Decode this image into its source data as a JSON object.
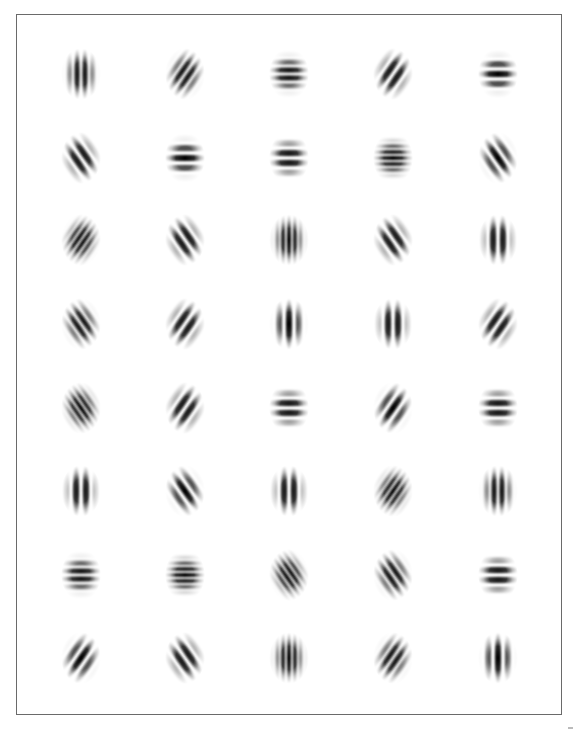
{
  "figure": {
    "rows": 8,
    "cols": 5,
    "col_centers": [
      81,
      185,
      289,
      393,
      498
    ],
    "row_centers": [
      74,
      158,
      240,
      324,
      408,
      491,
      575,
      658
    ],
    "ink_color": "#000000",
    "frame_color": "#6a6a6a",
    "patches": [
      [
        {
          "angle": 0,
          "freq": 3,
          "phase": "odd"
        },
        {
          "angle": 45,
          "freq": 3,
          "phase": "odd"
        },
        {
          "angle": 90,
          "freq": 3,
          "phase": "odd"
        },
        {
          "angle": 45,
          "freq": 2,
          "phase": "odd"
        },
        {
          "angle": 90,
          "freq": 2,
          "phase": "even"
        }
      ],
      [
        {
          "angle": 135,
          "freq": 2,
          "phase": "odd"
        },
        {
          "angle": 90,
          "freq": 2,
          "phase": "even"
        },
        {
          "angle": 90,
          "freq": 2,
          "phase": "odd"
        },
        {
          "angle": 90,
          "freq": 4,
          "phase": "even"
        },
        {
          "angle": 135,
          "freq": 2,
          "phase": "even"
        }
      ],
      [
        {
          "angle": 45,
          "freq": 4,
          "phase": "odd"
        },
        {
          "angle": 135,
          "freq": 2,
          "phase": "odd"
        },
        {
          "angle": 0,
          "freq": 4,
          "phase": "even"
        },
        {
          "angle": 135,
          "freq": 2,
          "phase": "odd"
        },
        {
          "angle": 0,
          "freq": 2,
          "phase": "odd"
        }
      ],
      [
        {
          "angle": 135,
          "freq": 3,
          "phase": "odd"
        },
        {
          "angle": 45,
          "freq": 2,
          "phase": "odd"
        },
        {
          "angle": 0,
          "freq": 2,
          "phase": "even"
        },
        {
          "angle": 0,
          "freq": 2,
          "phase": "odd"
        },
        {
          "angle": 45,
          "freq": 2,
          "phase": "odd"
        }
      ],
      [
        {
          "angle": 135,
          "freq": 4,
          "phase": "even"
        },
        {
          "angle": 45,
          "freq": 2,
          "phase": "odd"
        },
        {
          "angle": 90,
          "freq": 2,
          "phase": "odd"
        },
        {
          "angle": 45,
          "freq": 2,
          "phase": "even"
        },
        {
          "angle": 90,
          "freq": 2,
          "phase": "odd"
        }
      ],
      [
        {
          "angle": 0,
          "freq": 2,
          "phase": "odd"
        },
        {
          "angle": 135,
          "freq": 2,
          "phase": "even"
        },
        {
          "angle": 0,
          "freq": 2,
          "phase": "odd"
        },
        {
          "angle": 45,
          "freq": 4,
          "phase": "even"
        },
        {
          "angle": 0,
          "freq": 3,
          "phase": "odd"
        }
      ],
      [
        {
          "angle": 90,
          "freq": 3,
          "phase": "odd"
        },
        {
          "angle": 90,
          "freq": 4,
          "phase": "even"
        },
        {
          "angle": 135,
          "freq": 4,
          "phase": "odd"
        },
        {
          "angle": 135,
          "freq": 3,
          "phase": "odd"
        },
        {
          "angle": 90,
          "freq": 2,
          "phase": "odd"
        }
      ],
      [
        {
          "angle": 45,
          "freq": 2,
          "phase": "even"
        },
        {
          "angle": 135,
          "freq": 2,
          "phase": "odd"
        },
        {
          "angle": 0,
          "freq": 4,
          "phase": "even"
        },
        {
          "angle": 45,
          "freq": 3,
          "phase": "odd"
        },
        {
          "angle": 0,
          "freq": 2,
          "phase": "even"
        }
      ]
    ]
  }
}
